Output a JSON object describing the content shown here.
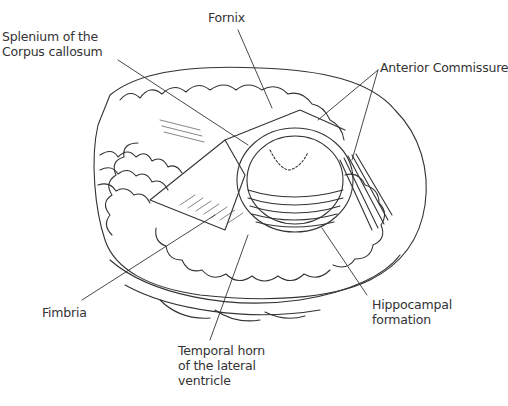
{
  "figure": {
    "line_color": "#333333",
    "background": "#ffffff"
  },
  "labels": {
    "splenium": {
      "lines": [
        "Splenium of the",
        "Corpus callosum"
      ]
    },
    "fornix": {
      "lines": [
        "Fornix"
      ]
    },
    "anterior_commissure": {
      "lines": [
        "Anterior Commissure"
      ]
    },
    "fimbria": {
      "lines": [
        "Fimbria"
      ]
    },
    "temporal_horn": {
      "lines": [
        "Temporal horn",
        "of the lateral",
        "ventricle"
      ]
    },
    "hippocampal_formation": {
      "lines": [
        "Hippocampal",
        "formation"
      ]
    }
  }
}
